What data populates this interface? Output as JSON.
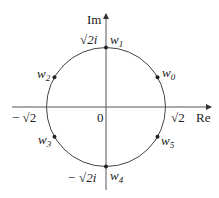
{
  "axes": {
    "x_label": "Re",
    "y_label": "Im",
    "origin_label": "0"
  },
  "ticks": {
    "re_pos": "√2",
    "re_neg": "− √2",
    "im_pos": "√2i",
    "im_neg": "− √2i"
  },
  "circle": {
    "center": [
      0,
      0
    ],
    "radius": "√2"
  },
  "points": [
    {
      "name": "w",
      "sub": "0",
      "angle_deg": 30
    },
    {
      "name": "w",
      "sub": "1",
      "angle_deg": 90
    },
    {
      "name": "w",
      "sub": "2",
      "angle_deg": 150
    },
    {
      "name": "w",
      "sub": "3",
      "angle_deg": 210
    },
    {
      "name": "w",
      "sub": "4",
      "angle_deg": 270
    },
    {
      "name": "w",
      "sub": "5",
      "angle_deg": 330
    }
  ],
  "colors": {
    "stroke": "#333333",
    "point": "#222222"
  }
}
